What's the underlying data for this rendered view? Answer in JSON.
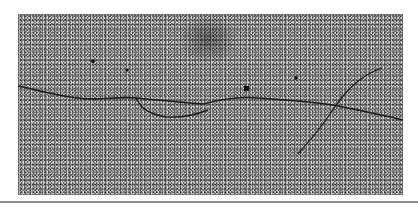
{
  "image": {
    "description": "Grayscale electron micrograph showing a long thin filament crossing a granular background, with a small loop and a second crossing strand",
    "colors": {
      "background": "#ffffff",
      "grain": "#d8d8d8",
      "filament": "#1a1a1a",
      "divider": "#8a8a8a"
    }
  }
}
